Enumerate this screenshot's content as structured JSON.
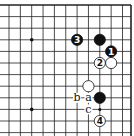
{
  "diagram": {
    "type": "go-board-corner",
    "grid": {
      "x0": 9,
      "y0": 5,
      "step_x": 11.35,
      "step_y": 11.6,
      "cols": 12,
      "rows": 12,
      "top_edge": true,
      "right_edge": true
    },
    "star_points": [
      [
        2,
        3
      ],
      [
        2,
        9
      ]
    ],
    "stones": [
      {
        "color": "black",
        "col": 8,
        "row": 3,
        "label": ""
      },
      {
        "color": "black",
        "col": 6,
        "row": 3,
        "label": "3"
      },
      {
        "color": "black",
        "col": 9,
        "row": 4,
        "label": "1"
      },
      {
        "color": "white",
        "col": 8,
        "row": 5,
        "label": "2"
      },
      {
        "color": "white",
        "col": 9,
        "row": 5,
        "label": ""
      },
      {
        "color": "white",
        "col": 7,
        "row": 7,
        "label": ""
      },
      {
        "color": "black",
        "col": 8,
        "row": 8,
        "label": ""
      },
      {
        "color": "white",
        "col": 8,
        "row": 10,
        "label": "4"
      }
    ],
    "marks": [
      {
        "text": "b",
        "col": 6,
        "row": 8
      },
      {
        "text": "a",
        "col": 7,
        "row": 8
      },
      {
        "text": "c",
        "col": 7,
        "row": 9
      }
    ],
    "small_dots": [
      [
        8,
        9
      ]
    ]
  }
}
